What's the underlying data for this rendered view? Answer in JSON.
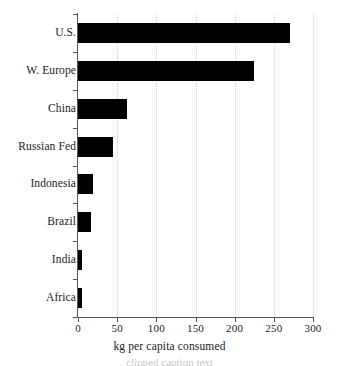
{
  "chart_data": {
    "type": "bar",
    "orientation": "horizontal",
    "title": "",
    "xlabel": "kg per capita consumed",
    "ylabel": "",
    "categories": [
      "U.S.",
      "W. Europe",
      "China",
      "Russian Fed",
      "Indonesia",
      "Brazil",
      "India",
      "Africa"
    ],
    "values": [
      270,
      225,
      63,
      45,
      19,
      17,
      5,
      5
    ],
    "xlim": [
      0,
      300
    ],
    "xticks": [
      0,
      50,
      100,
      150,
      200,
      250,
      300
    ],
    "xtick_labels": [
      "0",
      "50",
      "100",
      "150",
      "200",
      "250",
      "300"
    ],
    "grid": "vertical-dotted",
    "legend": "none",
    "bar_color": "#000000",
    "grid_color": "#d2d2d2",
    "axis_color": "#555555"
  },
  "caption": {
    "remnant": "clipped caption text"
  }
}
